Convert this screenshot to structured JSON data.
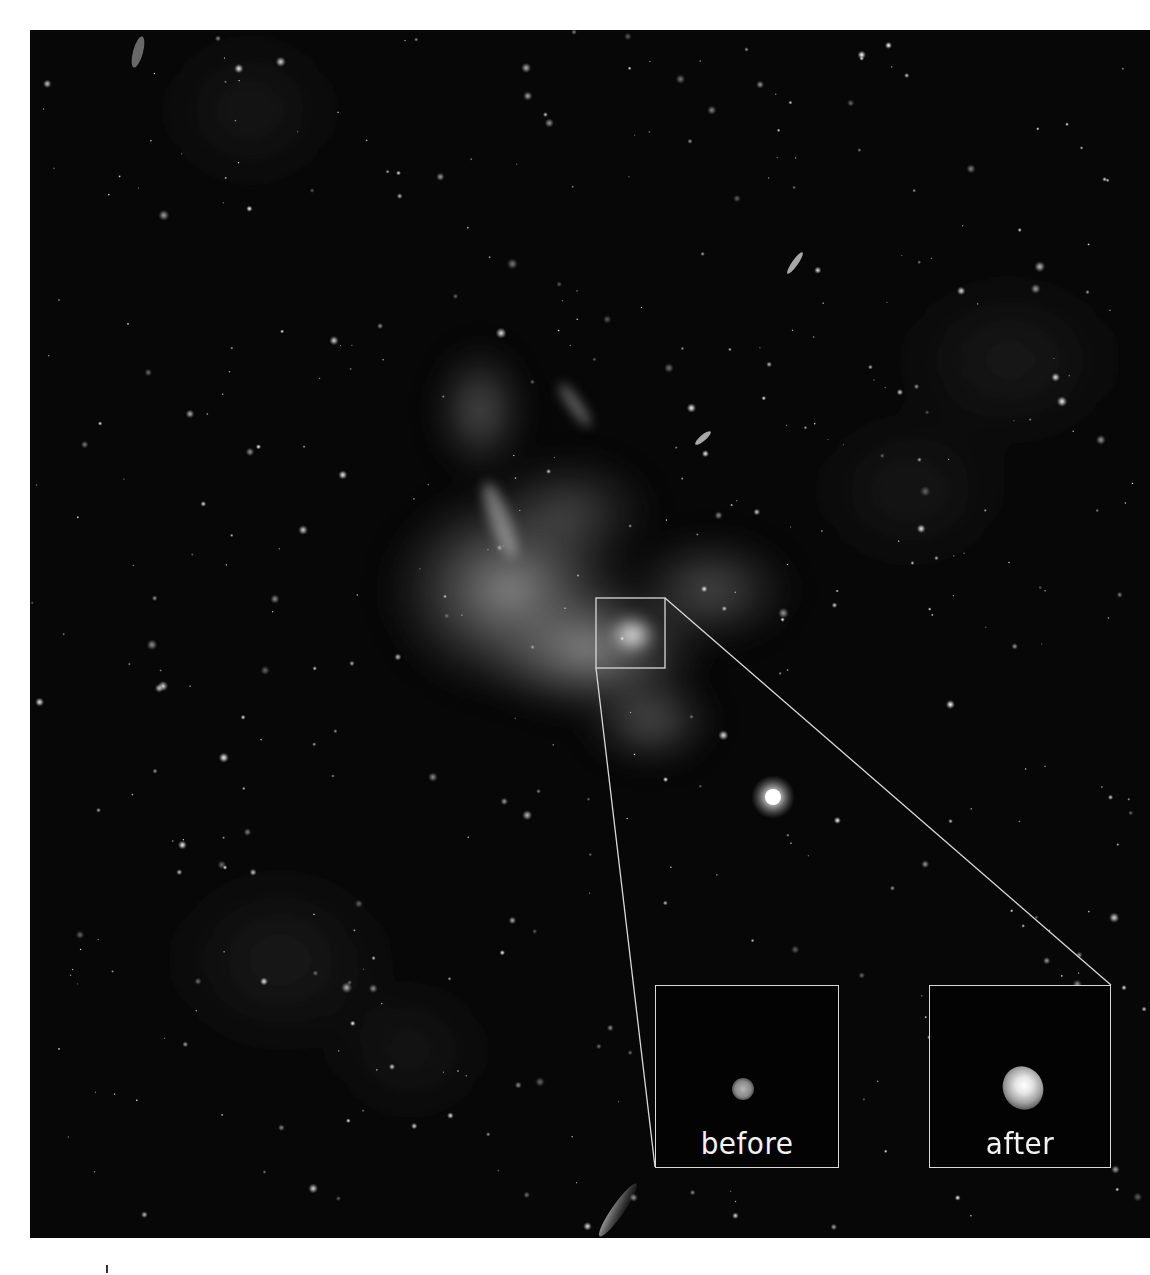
{
  "image": {
    "description": "Deep-space X-ray/infrared view of a galactic-center nebula with a zoom box highlighting a source",
    "frame": {
      "x": 30,
      "y": 30,
      "width": 1120,
      "height": 1208
    },
    "background_color": "#070707",
    "zoom_box": {
      "x": 596,
      "y": 598,
      "width": 69,
      "height": 70,
      "stroke": "#d8d8d8"
    }
  },
  "insets": [
    {
      "id": "before",
      "label": "before",
      "x": 655,
      "y": 985,
      "width": 184,
      "height": 183,
      "source": {
        "cx": 87,
        "cy": 103,
        "r": 11,
        "brightness": 0.55
      }
    },
    {
      "id": "after",
      "label": "after",
      "x": 929,
      "y": 985,
      "width": 182,
      "height": 183,
      "source": {
        "cx": 93,
        "cy": 102,
        "r": 20,
        "brightness": 1.0
      }
    }
  ],
  "colors": {
    "frame_border": "#d8d8d8",
    "label_text": "#f2f2f2",
    "page_background": "#ffffff"
  }
}
